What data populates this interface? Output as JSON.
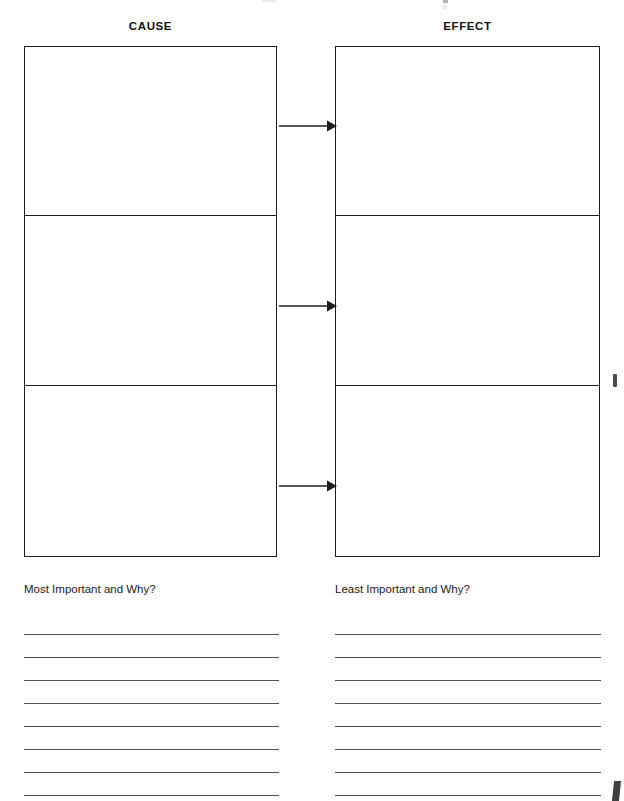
{
  "document": {
    "type": "cause-and-effect-graphic-organizer",
    "background_color": "#ffffff",
    "ink_color": "#1c1c1c"
  },
  "columns": {
    "cause": {
      "header": "CAUSE",
      "cells": [
        "",
        "",
        ""
      ]
    },
    "effect": {
      "header": "EFFECT",
      "cells": [
        "",
        "",
        ""
      ]
    }
  },
  "connectors": {
    "icon": "arrow-right-icon",
    "count": 3,
    "direction": "cause-to-effect"
  },
  "prompts": {
    "most_important": "Most Important and Why?",
    "least_important": "Least Important and Why?"
  },
  "writing_lines": {
    "left_count": 8,
    "right_count": 8,
    "left_values": [
      "",
      "",
      "",
      "",
      "",
      "",
      "",
      ""
    ],
    "right_values": [
      "",
      "",
      "",
      "",
      "",
      "",
      "",
      ""
    ]
  }
}
